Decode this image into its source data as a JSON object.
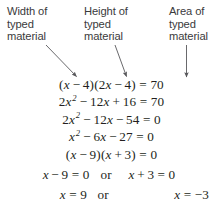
{
  "page": {
    "background_color": "#ffffff",
    "text_color": "#231f20",
    "label_color": "#3a3a3c"
  },
  "callouts": [
    {
      "id": "width",
      "text": "Width of\ntyped\nmaterial",
      "arrow": "diagonal-down-right",
      "points_to": "(x − 4)"
    },
    {
      "id": "height",
      "text": "Height of\ntyped\nmaterial",
      "arrow": "diagonal-down-right",
      "points_to": "(2x − 4)"
    },
    {
      "id": "area",
      "text": "Area of\ntyped\nmaterial",
      "arrow": "straight-down",
      "points_to": "70"
    }
  ],
  "derivation": {
    "steps": [
      {
        "id": "step-1",
        "plain": "(x − 4)(2x − 4) = 70",
        "parts": [
          "(",
          "x",
          "−",
          "4",
          ")(",
          "2",
          "x",
          "−",
          "4",
          ") = 70"
        ]
      },
      {
        "id": "step-2",
        "plain": "2x² − 12x + 16 = 70",
        "lead": "2",
        "var": "x",
        "exp": "2",
        "mid_op": "−",
        "mid_term": "12",
        "mid_var": "x",
        "tail_op": "+",
        "tail": "16 = 70"
      },
      {
        "id": "step-3",
        "plain": "2x² − 12x − 54 = 0",
        "lead": "2",
        "var": "x",
        "exp": "2",
        "mid_op": "−",
        "mid_term": "12",
        "mid_var": "x",
        "tail_op": "−",
        "tail": "54 = 0"
      },
      {
        "id": "step-4",
        "plain": "x² − 6x − 27 = 0",
        "lead": "",
        "var": "x",
        "exp": "2",
        "mid_op": "−",
        "mid_term": "6",
        "mid_var": "x",
        "tail_op": "−",
        "tail": "27 = 0"
      },
      {
        "id": "step-5",
        "plain": "(x − 9)(x + 3) = 0",
        "parts": [
          "(",
          "x",
          "−",
          "9",
          ")(",
          "",
          "x",
          "+",
          "3",
          ") = 0"
        ]
      }
    ],
    "zero_product_row": {
      "left": "x − 9 = 0",
      "left_var": "x",
      "left_op": "−",
      "left_tail": "9 = 0",
      "connector": "or",
      "right": "x + 3 = 0",
      "right_var": "x",
      "right_op": "+",
      "right_tail": "3 = 0"
    },
    "solutions_row": {
      "left": "x = 9",
      "left_var": "x",
      "left_tail": "= 9",
      "connector": "or",
      "right": "x = −3",
      "right_var": "x",
      "right_tail": "= −3"
    }
  }
}
